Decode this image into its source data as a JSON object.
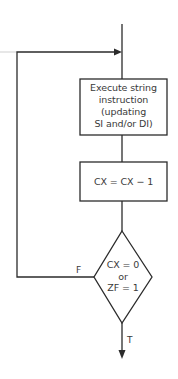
{
  "diagram": {
    "type": "flowchart",
    "nodes": [
      {
        "id": "execute",
        "shape": "rectangle",
        "lines": [
          "Execute string",
          "instruction",
          "(updating",
          "SI and/or DI)"
        ]
      },
      {
        "id": "decrement",
        "shape": "rectangle",
        "lines": [
          "CX = CX − 1"
        ]
      },
      {
        "id": "test",
        "shape": "diamond",
        "lines": [
          "CX = 0",
          "or",
          "ZF = 1"
        ]
      }
    ],
    "edges": [
      {
        "from": "entry",
        "to": "execute",
        "label": ""
      },
      {
        "from": "execute",
        "to": "decrement",
        "label": ""
      },
      {
        "from": "decrement",
        "to": "test",
        "label": ""
      },
      {
        "from": "test",
        "to": "execute",
        "label": "F"
      },
      {
        "from": "test",
        "to": "exit",
        "label": "T"
      }
    ],
    "labels": {
      "false": "F",
      "true": "T"
    },
    "colors": {
      "line": "#2b2b2b",
      "text": "#3a3a3a",
      "background": "#ffffff"
    }
  }
}
